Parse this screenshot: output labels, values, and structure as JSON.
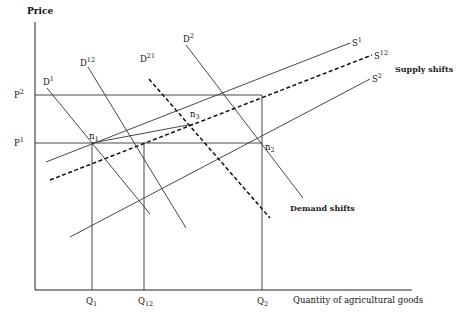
{
  "diagram": {
    "y_axis_label": "Price",
    "x_axis_label": "Quantity of agricultural goods",
    "price_levels": [
      {
        "label": "P",
        "sup": "2"
      },
      {
        "label": "P",
        "sup": "1"
      }
    ],
    "quantity_levels": [
      {
        "label": "Q",
        "sub": "1"
      },
      {
        "label": "Q",
        "sub": "12"
      },
      {
        "label": "Q",
        "sub": "2"
      }
    ],
    "demand_curves": [
      {
        "label": "D",
        "sup": "1",
        "style": "solid"
      },
      {
        "label": "D",
        "sup": "12",
        "style": "solid"
      },
      {
        "label": "D",
        "sup": "21",
        "style": "dashed"
      },
      {
        "label": "D",
        "sup": "2",
        "style": "solid"
      }
    ],
    "supply_curves": [
      {
        "label": "S",
        "sup": "1",
        "style": "solid"
      },
      {
        "label": "S",
        "sup": "12",
        "style": "dashed"
      },
      {
        "label": "S",
        "sup": "2",
        "style": "solid"
      }
    ],
    "equilibrium_points": [
      {
        "label": "n",
        "sub": "1"
      },
      {
        "label": "n",
        "sub": "2"
      },
      {
        "label": "n",
        "sub": "3"
      }
    ],
    "annotations": {
      "supply": "Supply shifts",
      "demand": "Demand shifts"
    }
  }
}
